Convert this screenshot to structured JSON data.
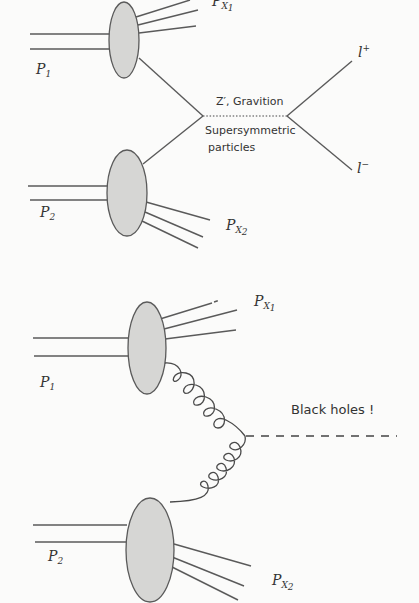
{
  "top_diagram": {
    "name": "Drell-Yan process",
    "labels": {
      "proton_1": "P",
      "proton_1_sub": "1",
      "proton_2": "P",
      "proton_2_sub": "2",
      "remnant_1": "P",
      "remnant_1_sub": "X",
      "remnant_1_subsub": "1",
      "remnant_2": "P",
      "remnant_2_sub": "X",
      "remnant_2_subsub": "2",
      "lepton_plus": "l",
      "lepton_plus_sup": "+",
      "lepton_minus": "l",
      "lepton_minus_sup": "−",
      "mediator": "Z′, Gravition",
      "mediator_alt_line1": "Supersymmetric",
      "mediator_alt_line2": "particles"
    }
  },
  "bottom_diagram": {
    "name": "Black hole production",
    "labels": {
      "proton_1": "P",
      "proton_1_sub": "1",
      "proton_2": "P",
      "proton_2_sub": "2",
      "remnant_1": "P",
      "remnant_1_sub": "X",
      "remnant_1_subsub": "1",
      "remnant_2": "P",
      "remnant_2_sub": "X",
      "remnant_2_subsub": "2",
      "product": "Black holes !"
    }
  },
  "colors": {
    "background": "#fbfbfa",
    "line": "#5a5a5a",
    "blob_fill": "#d6d6d4",
    "text": "#333333"
  }
}
